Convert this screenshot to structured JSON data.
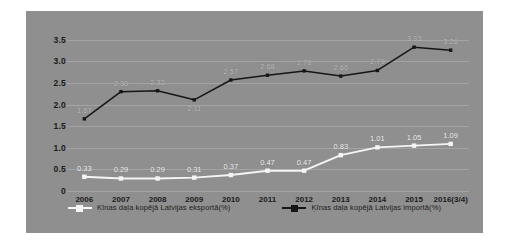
{
  "chart_data": {
    "type": "line",
    "title": "",
    "xlabel": "",
    "ylabel": "",
    "categories": [
      "2006",
      "2007",
      "2008",
      "2009",
      "2010",
      "2011",
      "2012",
      "2013",
      "2014",
      "2015",
      "2016(3/4)"
    ],
    "ylim": [
      0,
      3.75
    ],
    "yticks": [
      "0",
      "0.5",
      "1.0",
      "1.5",
      "2.0",
      "2.5",
      "3.0",
      "3.5"
    ],
    "ytick_values": [
      0,
      0.5,
      1.0,
      1.5,
      2.0,
      2.5,
      3.0,
      3.5
    ],
    "grid": true,
    "legend_position": "bottom",
    "series": [
      {
        "name": "Ķīnas daļa kopējā Latvijas eksportā(%)",
        "color": "#f5f5f5",
        "marker": "square",
        "values": [
          0.33,
          0.29,
          0.29,
          0.31,
          0.37,
          0.47,
          0.47,
          0.83,
          1.01,
          1.05,
          1.09
        ],
        "labels": [
          "0.33",
          "0.29",
          "0.29",
          "0.31",
          "0.37",
          "0.47",
          "0.47",
          "0.83",
          "1.01",
          "1.05",
          "1.09"
        ]
      },
      {
        "name": "Ķīnas daļa kopējā Latvijas importā(%)",
        "color": "#161616",
        "marker": "square",
        "values": [
          1.67,
          2.3,
          2.32,
          2.11,
          2.57,
          2.68,
          2.78,
          2.66,
          2.79,
          3.33,
          3.26
        ],
        "labels": [
          "1.67",
          "2.30",
          "2.32",
          "2.11",
          "2.57",
          "2.68",
          "2.78",
          "2.66",
          "2.79",
          "3.33",
          "3.26"
        ]
      }
    ]
  },
  "style": {
    "panel_bg": "#8f8f8f",
    "page_bg": "#ffffff",
    "axis_text": "#1b1b1b",
    "grid_color": "rgba(255,255,255,0.18)"
  },
  "legend": {
    "items": [
      {
        "label": "Ķīnas daļa kopējā Latvijas eksportā(%)",
        "color": "#f5f5f5"
      },
      {
        "label": "Ķīnas daļa kopējā Latvijas importā(%)",
        "color": "#161616"
      }
    ]
  }
}
